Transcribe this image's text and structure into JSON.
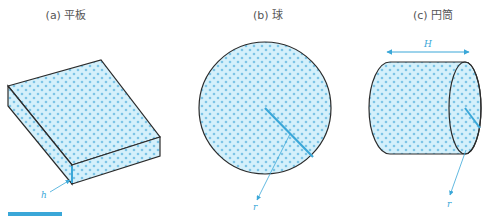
{
  "figures": [
    {
      "id": "a",
      "caption": "(a) 平板",
      "shape": "flat-plate",
      "dimension_label": "h"
    },
    {
      "id": "b",
      "caption": "(b) 球",
      "shape": "sphere",
      "dimension_label": "r"
    },
    {
      "id": "c",
      "caption": "(c) 円筒",
      "shape": "cylinder",
      "dimension_labels": [
        "H",
        "r"
      ]
    }
  ],
  "colors": {
    "fill": "#d4f0fb",
    "dot": "#7cc4e6",
    "outline": "#2b2b2b",
    "accent": "#3aa7d8",
    "caption_text": "#555555"
  }
}
